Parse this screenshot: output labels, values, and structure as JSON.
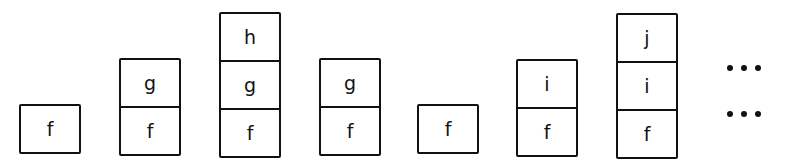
{
  "diagram": {
    "title": "",
    "stacks": [
      {
        "cells": [
          "f"
        ]
      },
      {
        "cells": [
          "f",
          "g"
        ]
      },
      {
        "cells": [
          "f",
          "g",
          "h"
        ]
      },
      {
        "cells": [
          "f",
          "g"
        ]
      },
      {
        "cells": [
          "f"
        ]
      },
      {
        "cells": [
          "f",
          "i"
        ]
      },
      {
        "cells": [
          "f",
          "i",
          "j"
        ]
      }
    ],
    "ellipsis": [
      "...",
      "..."
    ]
  }
}
